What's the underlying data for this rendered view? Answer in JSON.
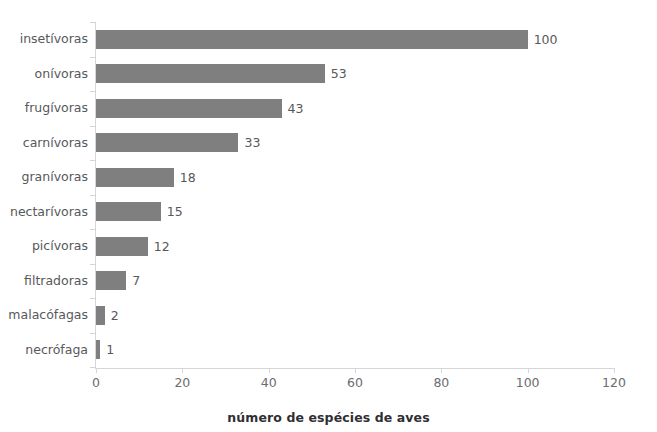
{
  "chart_data": {
    "type": "bar",
    "orientation": "horizontal",
    "title": "",
    "xlabel": "número de espécies de aves",
    "ylabel": "",
    "categories": [
      "insetívoras",
      "onívoras",
      "frugívoras",
      "carnívoras",
      "granívoras",
      "nectarívoras",
      "picívoras",
      "filtradoras",
      "malacófagas",
      "necrófaga"
    ],
    "values": [
      100,
      53,
      43,
      33,
      18,
      15,
      12,
      7,
      2,
      1
    ],
    "xlim": [
      0,
      120
    ],
    "xticks": [
      0,
      20,
      40,
      60,
      80,
      100,
      120
    ],
    "xtick_labels": [
      "0",
      "20",
      "40",
      "60",
      "80",
      "100",
      "120"
    ],
    "data_labels": [
      "100",
      "53",
      "43",
      "33",
      "18",
      "15",
      "12",
      "7",
      "2",
      "1"
    ],
    "grid": false,
    "legend": null,
    "bar_color": "#7f7f7f",
    "axis_color": "#d6d6d8",
    "label_color": "#58585b"
  },
  "title_remnant": "",
  "axis": {
    "x_title": "número de espécies de aves"
  }
}
